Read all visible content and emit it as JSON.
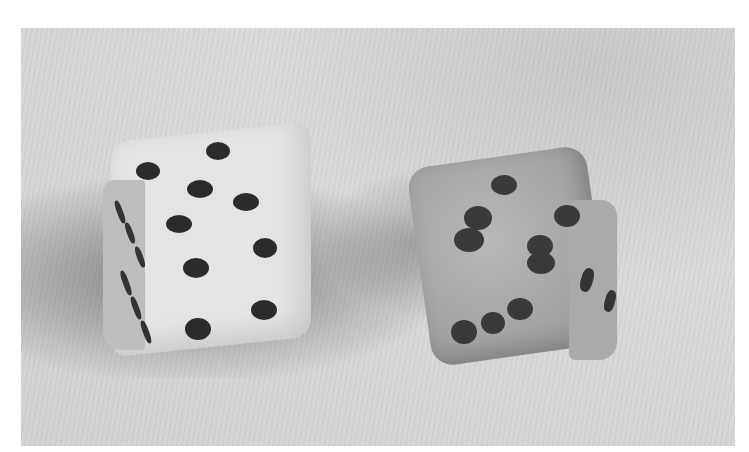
{
  "image": {
    "description": "Grayscale photograph of two dice resting on a textured cloth surface",
    "subjects": [
      {
        "name": "left-die",
        "tone": "light/white",
        "visible_faces": {
          "top_front": 5,
          "left_side": 6
        }
      },
      {
        "name": "right-die",
        "tone": "mottled gray",
        "visible_faces": {
          "front": 5,
          "right_side": 2
        }
      }
    ],
    "colors": {
      "background": "#ffffff",
      "surface": "#d4d4d4",
      "die_left": "#e2e2e2",
      "die_right": "#a8a8a8",
      "pips": "#2b2b2b"
    }
  }
}
